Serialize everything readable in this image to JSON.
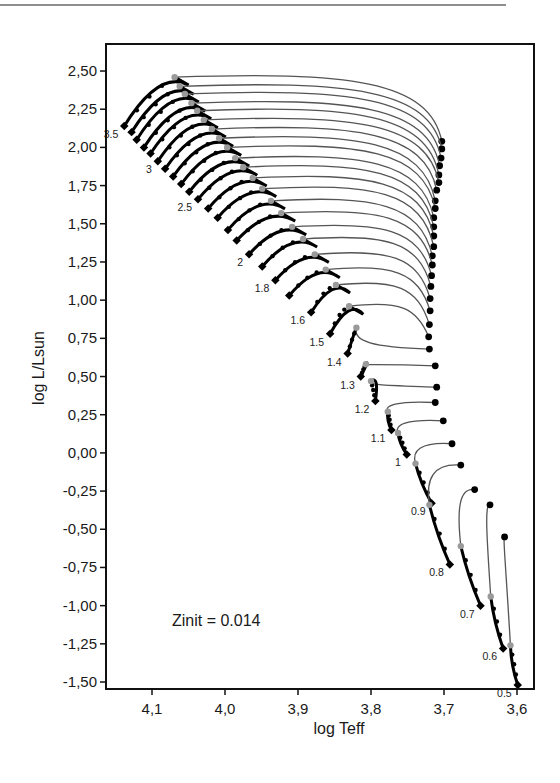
{
  "chart_data": {
    "type": "line",
    "title": "",
    "xlabel": "log Teff",
    "ylabel": "log L/Lsun",
    "xlim": [
      4.163,
      3.577
    ],
    "ylim": [
      -1.56,
      2.64
    ],
    "x_inverted": true,
    "grid": false,
    "legend": null,
    "xticks": [
      4.1,
      4.0,
      3.9,
      3.8,
      3.7,
      3.6
    ],
    "xtick_labels": [
      "4,1",
      "4,0",
      "3,9",
      "3,8",
      "3,7",
      "3,6"
    ],
    "yticks": [
      2.5,
      2.25,
      2.0,
      1.75,
      1.5,
      1.25,
      1.0,
      0.75,
      0.5,
      0.25,
      0.0,
      -0.25,
      -0.5,
      -0.75,
      -1.0,
      -1.25,
      -1.5
    ],
    "ytick_labels": [
      "2,50",
      "2,25",
      "2,00",
      "1,75",
      "1,50",
      "1,25",
      "1,00",
      "0,75",
      "0,50",
      "0,25",
      "0,00",
      "-0,25",
      "-0,50",
      "-0,75",
      "-1,00",
      "-1,25",
      "-1,50"
    ],
    "annotations": [
      {
        "text": "Zinit = 0.014",
        "x": 4.035,
        "y": -1.08
      }
    ],
    "series": [
      {
        "name": "3.5",
        "label": true,
        "hayashi": [
          3.703,
          2.04
        ],
        "turn": [
          4.069,
          2.46
        ],
        "zams": [
          4.138,
          2.14
        ]
      },
      {
        "name": "3.4",
        "label": false,
        "hayashi": [
          3.703,
          1.99
        ],
        "turn": [
          4.062,
          2.4
        ],
        "zams": [
          4.128,
          2.1
        ]
      },
      {
        "name": "3.3",
        "label": false,
        "hayashi": [
          3.704,
          1.93
        ],
        "turn": [
          4.055,
          2.35
        ],
        "zams": [
          4.121,
          2.05
        ]
      },
      {
        "name": "3.2",
        "label": false,
        "hayashi": [
          3.706,
          1.88
        ],
        "turn": [
          4.046,
          2.29
        ],
        "zams": [
          4.111,
          2.0
        ]
      },
      {
        "name": "3.1",
        "label": false,
        "hayashi": [
          3.707,
          1.82
        ],
        "turn": [
          4.038,
          2.24
        ],
        "zams": [
          4.102,
          1.96
        ]
      },
      {
        "name": "3",
        "label": true,
        "hayashi": [
          3.707,
          1.77
        ],
        "turn": [
          4.029,
          2.18
        ],
        "zams": [
          4.092,
          1.91
        ]
      },
      {
        "name": "2.9",
        "label": false,
        "hayashi": [
          3.71,
          1.72
        ],
        "turn": [
          4.018,
          2.12
        ],
        "zams": [
          4.082,
          1.86
        ]
      },
      {
        "name": "2.8",
        "label": false,
        "hayashi": [
          3.712,
          1.65
        ],
        "turn": [
          4.008,
          2.06
        ],
        "zams": [
          4.071,
          1.81
        ]
      },
      {
        "name": "2.7",
        "label": false,
        "hayashi": [
          3.712,
          1.6
        ],
        "turn": [
          3.997,
          2.0
        ],
        "zams": [
          4.06,
          1.76
        ]
      },
      {
        "name": "2.6",
        "label": false,
        "hayashi": [
          3.714,
          1.54
        ],
        "turn": [
          3.986,
          1.93
        ],
        "zams": [
          4.049,
          1.71
        ]
      },
      {
        "name": "2.5",
        "label": true,
        "hayashi": [
          3.714,
          1.48
        ],
        "turn": [
          3.975,
          1.87
        ],
        "zams": [
          4.037,
          1.66
        ]
      },
      {
        "name": "2.4",
        "label": false,
        "hayashi": [
          3.714,
          1.42
        ],
        "turn": [
          3.962,
          1.8
        ],
        "zams": [
          4.023,
          1.6
        ]
      },
      {
        "name": "2.3",
        "label": false,
        "hayashi": [
          3.714,
          1.35
        ],
        "turn": [
          3.949,
          1.73
        ],
        "zams": [
          4.01,
          1.54
        ]
      },
      {
        "name": "2.2",
        "label": false,
        "hayashi": [
          3.716,
          1.29
        ],
        "turn": [
          3.937,
          1.65
        ],
        "zams": [
          3.996,
          1.46
        ]
      },
      {
        "name": "2.1",
        "label": false,
        "hayashi": [
          3.716,
          1.23
        ],
        "turn": [
          3.923,
          1.57
        ],
        "zams": [
          3.984,
          1.39
        ]
      },
      {
        "name": "2",
        "label": true,
        "hayashi": [
          3.717,
          1.16
        ],
        "turn": [
          3.908,
          1.48
        ],
        "zams": [
          3.967,
          1.3
        ]
      },
      {
        "name": "1.9",
        "label": false,
        "hayashi": [
          3.718,
          1.09
        ],
        "turn": [
          3.893,
          1.4
        ],
        "zams": [
          3.949,
          1.22
        ]
      },
      {
        "name": "1.8",
        "label": true,
        "hayashi": [
          3.719,
          1.01
        ],
        "turn": [
          3.877,
          1.3
        ],
        "zams": [
          3.931,
          1.13
        ]
      },
      {
        "name": "1.7",
        "label": false,
        "hayashi": [
          3.719,
          0.93
        ],
        "turn": [
          3.862,
          1.2
        ],
        "zams": [
          3.912,
          1.03
        ]
      },
      {
        "name": "1.6",
        "label": true,
        "hayashi": [
          3.72,
          0.84
        ],
        "turn": [
          3.848,
          1.1
        ],
        "zams": [
          3.882,
          0.92
        ]
      },
      {
        "name": "1.5",
        "label": true,
        "hayashi": [
          3.721,
          0.76
        ],
        "turn": [
          3.83,
          0.96
        ],
        "zams": [
          3.856,
          0.78
        ]
      },
      {
        "name": "1.4",
        "label": true,
        "hayashi": [
          3.72,
          0.68
        ],
        "turn": [
          3.82,
          0.82
        ],
        "zams": [
          3.832,
          0.65
        ]
      },
      {
        "name": "1.3",
        "label": true,
        "hayashi": [
          3.712,
          0.57
        ],
        "turn": [
          3.807,
          0.58
        ],
        "zams": [
          3.814,
          0.5
        ]
      },
      {
        "name": "1.2",
        "label": true,
        "hayashi": [
          3.71,
          0.43
        ],
        "turn": [
          3.8,
          0.47
        ],
        "zams": [
          3.794,
          0.34
        ]
      },
      {
        "name": "1.1",
        "label": true,
        "hayashi": [
          3.712,
          0.33
        ],
        "turn": [
          3.777,
          0.27
        ],
        "zams": [
          3.772,
          0.15
        ]
      },
      {
        "name": "1",
        "label": true,
        "hayashi": [
          3.701,
          0.21
        ],
        "turn": [
          3.763,
          0.13
        ],
        "zams": [
          3.751,
          -0.01
        ]
      },
      {
        "name": "0.9",
        "label": true,
        "hayashi": [
          3.689,
          0.06
        ],
        "turn": [
          3.739,
          -0.07
        ],
        "zams": [
          3.717,
          -0.33
        ]
      },
      {
        "name": "0.8",
        "label": true,
        "hayashi": [
          3.677,
          -0.08
        ],
        "turn": [
          3.72,
          -0.34
        ],
        "zams": [
          3.692,
          -0.73
        ]
      },
      {
        "name": "0.7",
        "label": true,
        "hayashi": [
          3.658,
          -0.24
        ],
        "turn": [
          3.677,
          -0.61
        ],
        "zams": [
          3.65,
          -1.0
        ]
      },
      {
        "name": "0.6",
        "label": true,
        "hayashi": [
          3.637,
          -0.34
        ],
        "turn": [
          3.636,
          -0.94
        ],
        "zams": [
          3.619,
          -1.28
        ]
      },
      {
        "name": "0.5",
        "label": true,
        "hayashi": [
          3.617,
          -0.55
        ],
        "turn": [
          3.609,
          -1.26
        ],
        "zams": [
          3.599,
          -1.52
        ]
      }
    ]
  },
  "axes": {
    "xlabel": "log Teff",
    "ylabel": "log L/Lsun"
  },
  "annotation": {
    "text": "Zinit = 0.014"
  }
}
